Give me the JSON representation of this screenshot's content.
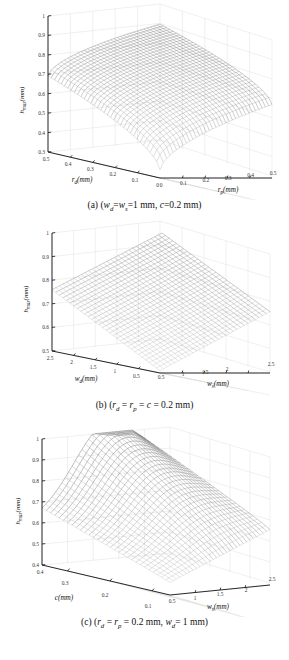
{
  "figure": {
    "title": "",
    "background_color": "#ffffff",
    "panel_count": 3
  },
  "chart_data": [
    {
      "type": "surface",
      "panel": "a",
      "caption": "(a) (w_d=w_s=1 mm, c=0.2 mm)",
      "caption_parts": {
        "prefix": "(a) (",
        "var1": "w",
        "var1_sub": "d",
        "eq1": "=",
        "var2": "w",
        "var2_sub": "s",
        "eq2": "=1 mm, ",
        "var3": "c",
        "eq3": "=0.2 mm)"
      },
      "zlabel": "h_max(mm)",
      "zlabel_parts": {
        "sym": "h",
        "sub": "max",
        "unit": "(mm)"
      },
      "xlabel": "r_d(mm)",
      "xlabel_parts": {
        "sym": "r",
        "sub": "d",
        "unit": "(mm)"
      },
      "ylabel": "r_p(mm)",
      "ylabel_parts": {
        "sym": "r",
        "sub": "p",
        "unit": "(mm)"
      },
      "zticks": [
        "0.3",
        "0.4",
        "0.5",
        "0.6",
        "0.7",
        "0.8",
        "0.9",
        "1"
      ],
      "zlim": [
        0.3,
        1.0
      ],
      "xticks": [
        "0.5",
        "0.4",
        "0.3",
        "0.2",
        "0.1",
        "0"
      ],
      "xlim": [
        0.5,
        0.0
      ],
      "yticks": [
        "0",
        "0.1",
        "0.2",
        "0.3",
        "0.4",
        "0.5"
      ],
      "ylim": [
        0.0,
        0.5
      ],
      "grid": true,
      "mesh_n": 34,
      "surface_description": "Dome-shaped mesh surface rising from low corner values near 0.33 at (rd=0, rp=0) to a peak near 1.0 at mid-to-far corner",
      "corner_values": {
        "near": 0.33,
        "left": 0.62,
        "right": 0.6,
        "far": 0.99
      },
      "peak_value": 1.0,
      "min_value": 0.33
    },
    {
      "type": "surface",
      "panel": "b",
      "caption": "(b) (r_d = r_p = c = 0.2 mm)",
      "caption_parts": {
        "prefix": "(b) (",
        "var1": "r",
        "var1_sub": "d",
        "eq1": " = ",
        "var2": "r",
        "var2_sub": "p",
        "eq2": " = ",
        "var3": "c",
        "eq3": " = 0.2 mm)"
      },
      "zlabel": "h_max(mm)",
      "zlabel_parts": {
        "sym": "h",
        "sub": "max",
        "unit": "(mm)"
      },
      "xlabel": "w_d(mm)",
      "xlabel_parts": {
        "sym": "w",
        "sub": "d",
        "unit": "(mm)"
      },
      "ylabel": "w_s(mm)",
      "ylabel_parts": {
        "sym": "w",
        "sub": "s",
        "unit": "(mm)"
      },
      "zticks": [
        "0.5",
        "0.6",
        "0.7",
        "0.8",
        "0.9",
        "1"
      ],
      "zlim": [
        0.5,
        1.0
      ],
      "xticks": [
        "2.5",
        "2",
        "1.5",
        "1",
        "0.5"
      ],
      "xlim": [
        2.5,
        0.5
      ],
      "yticks": [
        "0.5",
        "1",
        "1.5",
        "2",
        "2.5"
      ],
      "ylim": [
        0.5,
        2.5
      ],
      "grid": true,
      "mesh_n": 30,
      "surface_description": "Near-planar tilted mesh sheet rising linearly from about 0.5 at the near corner to 1.0 at the far corner",
      "corner_values": {
        "near": 0.5,
        "left": 0.75,
        "right": 0.75,
        "far": 1.0
      },
      "peak_value": 1.0,
      "min_value": 0.5
    },
    {
      "type": "surface",
      "panel": "c",
      "caption": "(c) (r_d = r_p = 0.2 mm, w_d= 1 mm)",
      "caption_parts": {
        "prefix": "(c) (",
        "var1": "r",
        "var1_sub": "d",
        "eq1": " = ",
        "var2": "r",
        "var2_sub": "p",
        "eq2": " = 0.2 mm, ",
        "var3": "w",
        "var3_sub": "d",
        "eq3": "= 1 mm)"
      },
      "zlabel": "h_max(mm)",
      "zlabel_parts": {
        "sym": "h",
        "sub": "max",
        "unit": "(mm)"
      },
      "xlabel": "c(mm)",
      "xlabel_parts": {
        "sym": "c",
        "sub": "",
        "unit": "(mm)"
      },
      "ylabel": "w_s(mm)",
      "ylabel_parts": {
        "sym": "w",
        "sub": "s",
        "unit": "(mm)"
      },
      "zticks": [
        "0.4",
        "0.5",
        "0.6",
        "0.7",
        "0.8",
        "0.9",
        "1"
      ],
      "zlim": [
        0.4,
        1.0
      ],
      "xticks": [
        "0.4",
        "0.3",
        "0.2",
        "0.1"
      ],
      "xlim": [
        0.4,
        0.1
      ],
      "yticks": [
        "0.5",
        "1",
        "1.5",
        "2",
        "2.5"
      ],
      "ylim": [
        0.5,
        2.5
      ],
      "grid": true,
      "mesh_n": 30,
      "surface_description": "Saddle/ridged mesh surface; low near the front-left (c large, ws small) around 0.45, rising to a broad hump near 1.0 toward the back where ws is large and c is small",
      "corner_values": {
        "near": 0.45,
        "left": 0.5,
        "right": 0.62,
        "far": 1.0
      },
      "peak_value": 1.0,
      "min_value": 0.43
    }
  ]
}
